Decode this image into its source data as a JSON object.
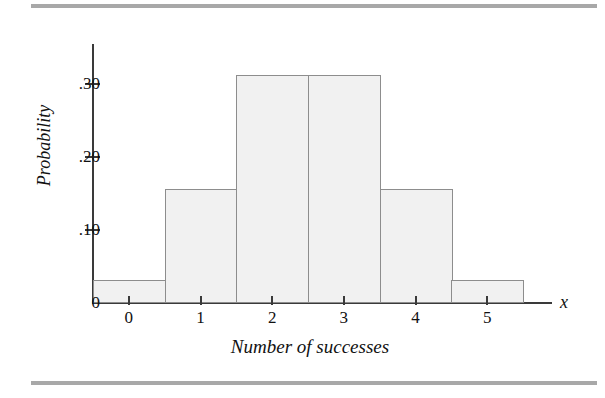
{
  "figure": {
    "rule_color": "#a8a8a8",
    "bar_fill": "#f1f1f1",
    "bar_stroke": "#8d8d8d",
    "axis_color": "#3a3a3a",
    "x_variable_label": "x"
  },
  "chart_data": {
    "type": "bar",
    "title": "",
    "subtitle": "",
    "xlabel": "Number of successes",
    "ylabel": "Probability",
    "categories": [
      "0",
      "1",
      "2",
      "3",
      "4",
      "5"
    ],
    "values": [
      0.03125,
      0.15625,
      0.3125,
      0.3125,
      0.15625,
      0.03125
    ],
    "x": [
      0,
      1,
      2,
      3,
      4,
      5
    ],
    "xlim": [
      -0.5,
      5.5
    ],
    "ylim": [
      0,
      0.355
    ],
    "ytick_labels": [
      "0",
      ".10",
      ".20",
      ".30"
    ],
    "ytick_values": [
      0,
      0.1,
      0.2,
      0.3
    ],
    "xtick_labels": [
      "0",
      "1",
      "2",
      "3",
      "4",
      "5"
    ],
    "grid": false,
    "legend": "none",
    "annotations": [
      "x"
    ]
  }
}
